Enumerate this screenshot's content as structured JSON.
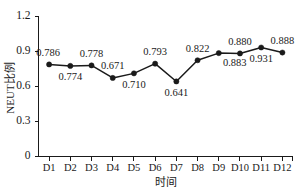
{
  "chart_data": {
    "type": "line",
    "title": "",
    "xlabel": "时间",
    "ylabel": "NEUT比例",
    "categories": [
      "D1",
      "D2",
      "D3",
      "D4",
      "D5",
      "D6",
      "D7",
      "D8",
      "D9",
      "D10",
      "D11",
      "D12"
    ],
    "values": [
      0.786,
      0.774,
      0.778,
      0.671,
      0.71,
      0.793,
      0.641,
      0.822,
      0.883,
      0.88,
      0.931,
      0.888
    ],
    "point_labels": [
      "0.786",
      "0.774",
      "0.778",
      "0.671",
      "0.710",
      "0.793",
      "0.641",
      "0.822",
      "0.883",
      "0.880",
      "0.931",
      "0.888"
    ],
    "label_positions": [
      "above",
      "below",
      "above",
      "above",
      "below",
      "above",
      "below",
      "above",
      "below-right",
      "above",
      "below",
      "above"
    ],
    "ylim": [
      0,
      1.2
    ],
    "yticks": [
      0,
      0.3,
      0.6,
      0.9,
      1.2
    ],
    "ytick_labels": [
      "0",
      "0.3",
      "0.6",
      "0.9",
      "1.2"
    ],
    "grid": false,
    "legend": "none",
    "series_color": "#1a1a1a",
    "marker": "circle",
    "background": "#ffffff"
  }
}
